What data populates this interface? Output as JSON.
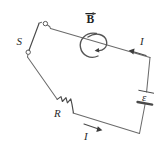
{
  "figure": {
    "type": "physics-circuit-diagram",
    "background_color": "#ffffff",
    "line_color": "#6b6b6b",
    "label_color": "#2b2b2b"
  },
  "labels": {
    "switch": "S",
    "resistor": "R",
    "emf": "ε",
    "field": "B",
    "current_top": "I",
    "current_bottom": "I"
  },
  "components": [
    {
      "name": "switch",
      "label": "S",
      "state": "open",
      "description": "Open knife switch on the upper-left side of the loop"
    },
    {
      "name": "resistor",
      "label": "R",
      "symbol": "zigzag",
      "description": "Resistor on the lower-left branch of the loop"
    },
    {
      "name": "battery",
      "label": "ε",
      "symbol": "cell",
      "description": "EMF source (battery) on the right branch of the loop"
    },
    {
      "name": "magnetic-field",
      "label": "B",
      "symbol": "vector-with-rotation-arrow",
      "description": "Magnetic field vector B with a curved arrow indicating rotation about the top wire"
    }
  ],
  "currents": [
    {
      "label": "I",
      "position": "top-right",
      "direction": "leftward along top wire"
    },
    {
      "label": "I",
      "position": "bottom-center",
      "direction": "rightward along bottom wire"
    }
  ]
}
